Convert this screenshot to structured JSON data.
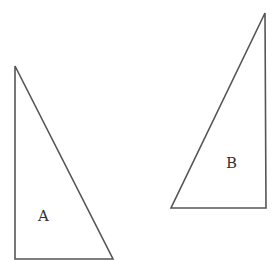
{
  "diagram": {
    "type": "geometry-figure",
    "stroke_color": "#555555",
    "shapes": [
      {
        "id": "triangle-a",
        "label": "A",
        "kind": "right-triangle",
        "points": [
          [
            15,
            66
          ],
          [
            15,
            259
          ],
          [
            113,
            259
          ]
        ],
        "label_pos": [
          45,
          216
        ]
      },
      {
        "id": "triangle-b",
        "label": "B",
        "kind": "right-triangle",
        "points": [
          [
            265,
            13
          ],
          [
            266,
            208
          ],
          [
            171,
            208
          ]
        ],
        "label_pos": [
          233,
          166
        ]
      }
    ]
  }
}
